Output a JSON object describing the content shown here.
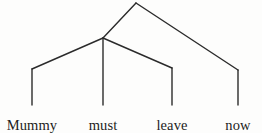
{
  "figure": {
    "kind": "syntax-tree-diagram",
    "sentence": "Mummy must leave now",
    "background_color": "#fdfdfc",
    "line_color": "#2b2b2b",
    "text_color": "#1d1d1d",
    "line_width": 1.4,
    "canvas": {
      "width": 262,
      "height": 133
    }
  },
  "nodes": {
    "root": {
      "name": "root-node",
      "x": 136,
      "y": 3
    },
    "internal": {
      "name": "internal-node",
      "x": 103,
      "y": 38
    },
    "elbow_mummy": {
      "name": "elbow-mummy",
      "x": 32,
      "y": 69
    },
    "elbow_must": {
      "name": "elbow-must",
      "x": 103,
      "y": 38
    },
    "elbow_leave": {
      "name": "elbow-leave",
      "x": 172,
      "y": 68
    },
    "elbow_now": {
      "name": "elbow-now",
      "x": 238,
      "y": 70
    }
  },
  "branches": [
    {
      "name": "branch-root-to-internal",
      "x1": 136,
      "y1": 3,
      "x2": 103,
      "y2": 38
    },
    {
      "name": "branch-root-to-now",
      "x1": 136,
      "y1": 3,
      "x2": 238,
      "y2": 70
    },
    {
      "name": "branch-internal-to-mummy",
      "x1": 103,
      "y1": 38,
      "x2": 32,
      "y2": 69
    },
    {
      "name": "branch-internal-to-leave",
      "x1": 103,
      "y1": 38,
      "x2": 172,
      "y2": 68
    },
    {
      "name": "stem-mummy",
      "x1": 32,
      "y1": 69,
      "x2": 32,
      "y2": 105
    },
    {
      "name": "stem-must",
      "x1": 103,
      "y1": 38,
      "x2": 103,
      "y2": 105
    },
    {
      "name": "stem-leave",
      "x1": 172,
      "y1": 68,
      "x2": 172,
      "y2": 105
    },
    {
      "name": "stem-now",
      "x1": 238,
      "y1": 70,
      "x2": 238,
      "y2": 105
    }
  ],
  "leaves": [
    {
      "name": "leaf-mummy",
      "label": "Mummy",
      "x": 32,
      "y": 118
    },
    {
      "name": "leaf-must",
      "label": "must",
      "x": 103,
      "y": 118
    },
    {
      "name": "leaf-leave",
      "label": "leave",
      "x": 172,
      "y": 118
    },
    {
      "name": "leaf-now",
      "label": "now",
      "x": 238,
      "y": 118
    }
  ]
}
